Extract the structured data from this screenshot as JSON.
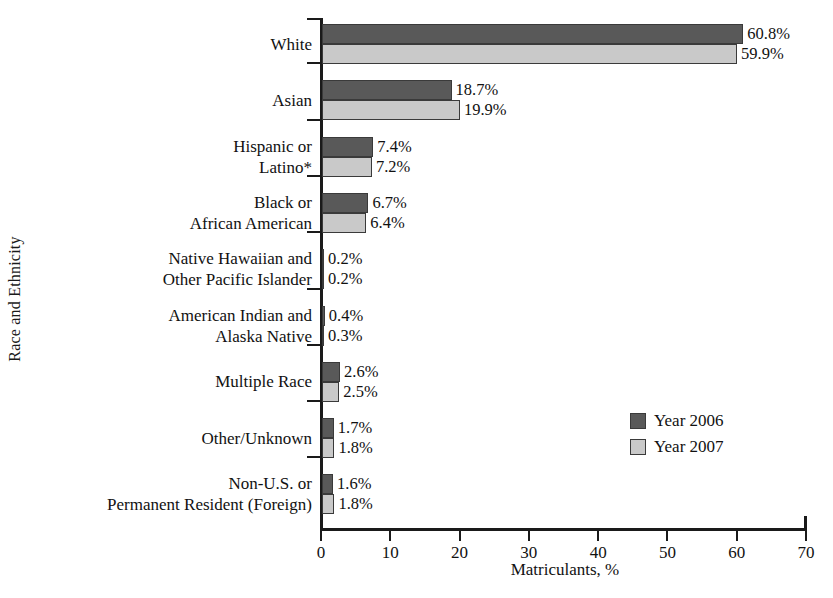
{
  "chart_data": {
    "type": "bar",
    "orientation": "horizontal",
    "title": "",
    "xlabel": "Matriculants, %",
    "ylabel": "Race and Ethnicity",
    "xlim": [
      0,
      70
    ],
    "xticks": [
      0,
      10,
      20,
      30,
      40,
      50,
      60,
      70
    ],
    "xtick_labels": [
      "0",
      "10",
      "20",
      "30",
      "40",
      "50",
      "60",
      "70"
    ],
    "grid": false,
    "legend_position": "center-right",
    "categories": [
      "White",
      "Asian",
      "Hispanic or\nLatino*",
      "Black or\nAfrican American",
      "Native Hawaiian and\nOther Pacific Islander",
      "American Indian and\nAlaska Native",
      "Multiple Race",
      "Other/Unknown",
      "Non-U.S. or\nPermanent Resident (Foreign)"
    ],
    "series": [
      {
        "name": "Year 2006",
        "color": "#595959",
        "values": [
          60.8,
          18.7,
          7.4,
          6.7,
          0.2,
          0.4,
          2.6,
          1.7,
          1.6
        ],
        "value_labels": [
          "60.8%",
          "18.7%",
          "7.4%",
          "6.7%",
          "0.2%",
          "0.4%",
          "2.6%",
          "1.7%",
          "1.6%"
        ]
      },
      {
        "name": "Year 2007",
        "color": "#c9c9c9",
        "values": [
          59.9,
          19.9,
          7.2,
          6.4,
          0.2,
          0.3,
          2.5,
          1.8,
          1.8
        ],
        "value_labels": [
          "59.9%",
          "19.9%",
          "7.2%",
          "6.4%",
          "0.2%",
          "0.3%",
          "2.5%",
          "1.8%",
          "1.8%"
        ]
      }
    ]
  }
}
